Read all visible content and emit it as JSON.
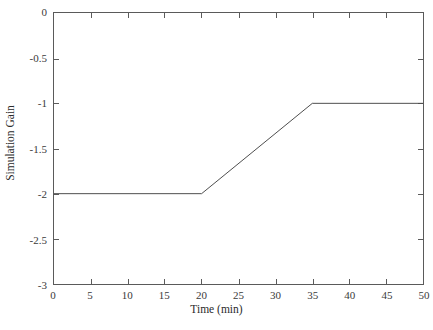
{
  "chart_data": {
    "type": "line",
    "title": "",
    "xlabel": "Time (min)",
    "ylabel": "Simulation Gain",
    "xlim": [
      0,
      50
    ],
    "ylim": [
      -3,
      0
    ],
    "grid": false,
    "legend": false,
    "xticks": [
      0,
      5,
      10,
      15,
      20,
      25,
      30,
      35,
      40,
      45,
      50
    ],
    "xticklabels": [
      "0",
      "5",
      "10",
      "15",
      "20",
      "25",
      "30",
      "35",
      "40",
      "45",
      "50"
    ],
    "yticks": [
      0,
      -0.5,
      -1,
      -1.5,
      -2,
      -2.5,
      -3
    ],
    "yticklabels": [
      "0",
      "-0.5",
      "-1",
      "-1.5",
      "-2",
      "-2.5",
      "-3"
    ],
    "series": [
      {
        "name": "Simulation Gain",
        "color": "#4d4d4d",
        "linewidth": 1,
        "x": [
          0,
          20,
          35,
          50
        ],
        "y": [
          -2,
          -2,
          -1,
          -1
        ]
      }
    ],
    "annotations": [
      {
        "text": "flat segment at gain -2 from 0 to 20 min"
      },
      {
        "text": "linear ramp from -2 to -1 between 20 and 35 min"
      },
      {
        "text": "flat segment at gain -1 from 35 to 50 min"
      }
    ]
  },
  "axes": {
    "frame_color": "#5a5a5a",
    "tick_color": "#5a5a5a",
    "background": "#ffffff"
  }
}
